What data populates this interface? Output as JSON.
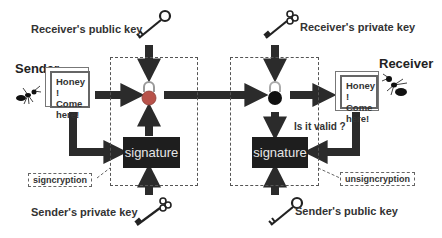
{
  "diagram": {
    "type": "signcryption-flow",
    "labels": {
      "receiver_public_key": "Receiver's public key",
      "receiver_private_key": "Receiver's private key",
      "sender_private_key": "Sender's private key",
      "sender_public_key": "Sender's public key",
      "sender": "Sender",
      "receiver": "Receiver",
      "is_it_valid": "Is it valid ?"
    },
    "left_message": {
      "line1": "Honey !",
      "line2": "Come",
      "line3": "here!"
    },
    "right_message": {
      "line1": "Honey !",
      "line2": "Come",
      "line3": "here!"
    },
    "left_signature": "signature",
    "right_signature": "signature",
    "left_process_tag": "signcryption",
    "right_process_tag": "unsigncryption",
    "icons": {
      "left_lock": "padlock-icon (colored, locked)",
      "right_lock": "padlock-icon (dark, unlocked)",
      "keys": [
        "key-icon",
        "key-icon",
        "key-icon",
        "key-icon"
      ],
      "ants": [
        "ant-icon",
        "ant-icon"
      ]
    },
    "colors": {
      "arrow": "#2b2b2b",
      "signature_bg": "#1e1e1e",
      "signature_text": "#e6e6e6",
      "lock_left": "#b8524a",
      "lock_right": "#111111"
    }
  }
}
